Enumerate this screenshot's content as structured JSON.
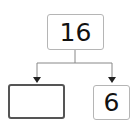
{
  "diagram": {
    "type": "number-bond",
    "whole": {
      "value": "16"
    },
    "parts": [
      {
        "value": "",
        "state": "empty"
      },
      {
        "value": "6"
      }
    ],
    "colors": {
      "line": "#888888",
      "box_border": "#b5b5b5",
      "empty_box_border": "#555555",
      "text": "#111111"
    }
  }
}
